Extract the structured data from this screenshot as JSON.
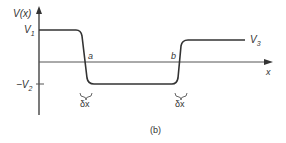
{
  "figure": {
    "caption": "(b)",
    "y_axis_label": "V(x)",
    "x_axis_label": "x",
    "level_labels": {
      "v1": "V",
      "v1_sub": "1",
      "v2": "−V",
      "v2_sub": "2",
      "v3": "V",
      "v3_sub": "3"
    },
    "point_labels": {
      "a": "a",
      "b": "b"
    },
    "width_labels": {
      "left": "δx",
      "right": "δx"
    },
    "colors": {
      "line": "#333333",
      "text": "#333333",
      "background": "#ffffff"
    }
  }
}
